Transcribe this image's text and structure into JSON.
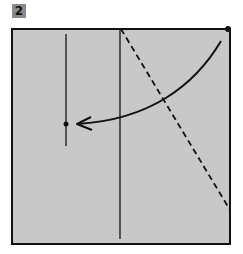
{
  "step": {
    "number": "2"
  },
  "colors": {
    "paper": "#c8c8c8",
    "line": "#111111",
    "badge": "#8a8a8a"
  },
  "diagram": {
    "square": {
      "x": 12,
      "y": 29,
      "w": 218,
      "h": 215
    },
    "creases": [
      {
        "type": "solid",
        "x1": 66,
        "y1": 34,
        "x2": 66,
        "y2": 146
      },
      {
        "type": "solid",
        "x1": 120,
        "y1": 29,
        "x2": 120,
        "y2": 239
      }
    ],
    "valley_fold": {
      "type": "dashed",
      "x1": 121,
      "y1": 29,
      "x2": 230,
      "y2": 210
    },
    "dots": [
      {
        "x": 228,
        "y": 29
      },
      {
        "x": 66,
        "y": 124
      }
    ],
    "arrow": {
      "from": [
        221,
        41
      ],
      "to": [
        76,
        124
      ]
    }
  }
}
